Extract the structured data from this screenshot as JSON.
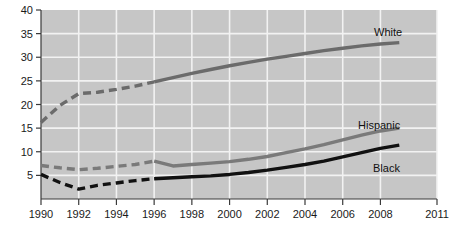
{
  "chart_data": {
    "type": "line",
    "title": "",
    "subtitle": "",
    "xlabel": "",
    "ylabel": "",
    "xlim": [
      1990,
      2011
    ],
    "ylim": [
      0,
      40
    ],
    "grid": true,
    "legend_position": "inline-right-labels",
    "plot_background": "#c6c6c6",
    "gridline_color": "#f2f2f2",
    "x_ticks": [
      "1990",
      "1992",
      "1994",
      "1996",
      "1998",
      "2000",
      "2002",
      "2004",
      "2006",
      "2008",
      "2011"
    ],
    "x_tick_values": [
      1990,
      1992,
      1994,
      1996,
      1998,
      2000,
      2002,
      2004,
      2006,
      2008,
      2011
    ],
    "y_ticks": [
      "5",
      "10",
      "15",
      "20",
      "25",
      "30",
      "35",
      "40"
    ],
    "y_tick_values": [
      5,
      10,
      15,
      20,
      25,
      30,
      35,
      40
    ],
    "dash_break_year": 1996,
    "series": [
      {
        "name": "White",
        "label": "White",
        "color": "#6b6b6b",
        "width": 3.4,
        "x": [
          1990,
          1991,
          1992,
          1993,
          1994,
          1995,
          1996,
          1997,
          1998,
          1999,
          2000,
          2001,
          2002,
          2003,
          2004,
          2005,
          2006,
          2007,
          2008,
          2009
        ],
        "values": [
          16.2,
          19.8,
          22.3,
          22.6,
          23.2,
          23.9,
          24.8,
          25.7,
          26.6,
          27.4,
          28.2,
          28.9,
          29.6,
          30.2,
          30.8,
          31.4,
          31.9,
          32.4,
          32.8,
          33.1
        ]
      },
      {
        "name": "Hispanic",
        "label": "Hispanic",
        "color": "#7a7a7a",
        "width": 3.4,
        "x": [
          1990,
          1991,
          1992,
          1993,
          1994,
          1995,
          1996,
          1997,
          1998,
          1999,
          2000,
          2001,
          2002,
          2003,
          2004,
          2005,
          2006,
          2007,
          2008,
          2009
        ],
        "values": [
          7.1,
          6.6,
          6.2,
          6.5,
          6.9,
          7.3,
          8.0,
          7.0,
          7.3,
          7.6,
          7.9,
          8.4,
          9.0,
          9.8,
          10.6,
          11.5,
          12.5,
          13.5,
          14.4,
          15.0
        ]
      },
      {
        "name": "Black",
        "label": "Black",
        "color": "#111111",
        "width": 3.4,
        "x": [
          1990,
          1991,
          1992,
          1993,
          1994,
          1995,
          1996,
          1997,
          1998,
          1999,
          2000,
          2001,
          2002,
          2003,
          2004,
          2005,
          2006,
          2007,
          2008,
          2009
        ],
        "values": [
          5.2,
          3.5,
          2.1,
          2.9,
          3.4,
          3.9,
          4.3,
          4.5,
          4.7,
          4.9,
          5.2,
          5.6,
          6.1,
          6.7,
          7.3,
          8.0,
          8.9,
          9.8,
          10.7,
          11.4
        ]
      }
    ],
    "annotations": [
      {
        "name": "White",
        "text": "White",
        "x_px": 374,
        "y_px": 36
      },
      {
        "name": "Hispanic",
        "text": "Hispanic",
        "x_px": 358,
        "y_px": 129
      },
      {
        "name": "Black",
        "text": "Black",
        "x_px": 373,
        "y_px": 172
      }
    ]
  }
}
